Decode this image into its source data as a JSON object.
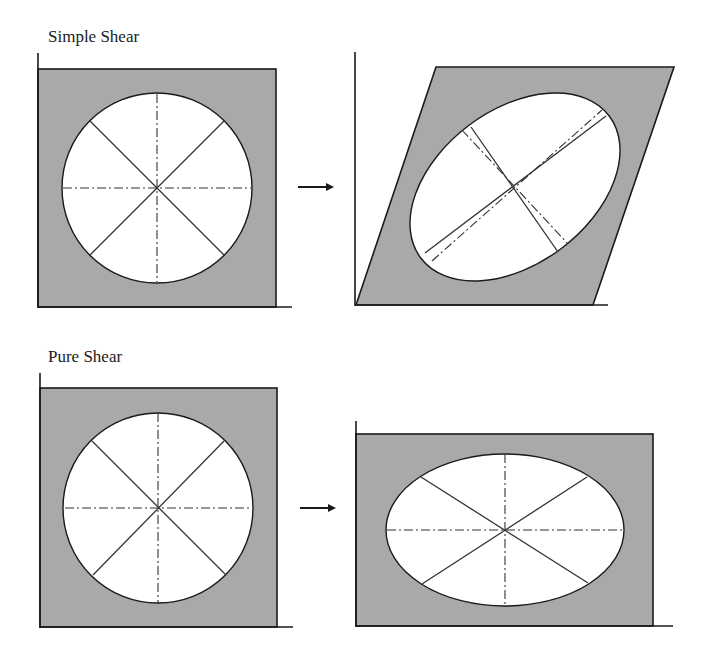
{
  "labels": {
    "simple_shear": "Simple Shear",
    "pure_shear": "Pure Shear"
  },
  "colors": {
    "fill_gray": "#a9a9a9",
    "stroke": "#1a1a1a",
    "ellipse_fill": "#ffffff",
    "background": "#ffffff"
  },
  "panels": [
    {
      "id": "simple-shear-before",
      "shape": "square",
      "strain_marker": "circle",
      "axes": "solid diagonals + dash-dot horizontal/vertical"
    },
    {
      "id": "simple-shear-after",
      "shape": "parallelogram",
      "strain_marker": "rotated ellipse",
      "axes": "solid principal axes + dash-dot rotated axes"
    },
    {
      "id": "pure-shear-before",
      "shape": "square",
      "strain_marker": "circle",
      "axes": "solid diagonals + dash-dot horizontal/vertical"
    },
    {
      "id": "pure-shear-after",
      "shape": "rectangle",
      "strain_marker": "horizontal ellipse",
      "axes": "solid diagonals + dash-dot horizontal/vertical"
    }
  ],
  "arrows": [
    {
      "from": "simple-shear-before",
      "to": "simple-shear-after",
      "glyph": "arrow-right"
    },
    {
      "from": "pure-shear-before",
      "to": "pure-shear-after",
      "glyph": "arrow-right"
    }
  ]
}
